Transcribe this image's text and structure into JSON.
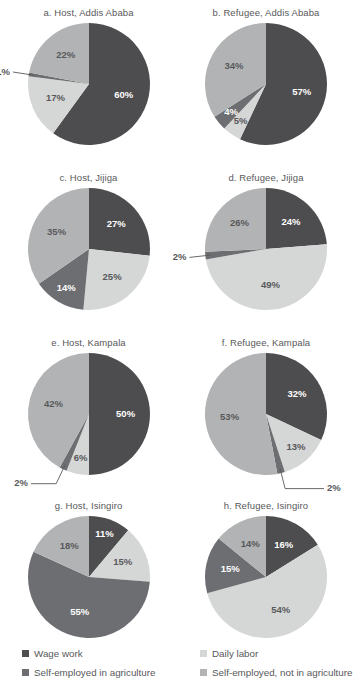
{
  "colors": {
    "wage_work": "#4d4d4f",
    "daily_labor": "#d5d6d6",
    "self_emp_ag": "#6d6e71",
    "self_emp_nonag": "#b1b3b4",
    "text": "#58595b",
    "background": "#ffffff"
  },
  "legend": {
    "items": [
      {
        "label": "Wage work",
        "color_key": "wage_work"
      },
      {
        "label": "Daily labor",
        "color_key": "daily_labor"
      },
      {
        "label": "Self-employed in agriculture",
        "color_key": "self_emp_ag"
      },
      {
        "label": "Self-employed, not in agriculture",
        "color_key": "self_emp_nonag"
      }
    ]
  },
  "chart_data": {
    "type": "pie",
    "title": "",
    "categories": [
      "Wage work",
      "Daily labor",
      "Self-employed in agriculture",
      "Self-employed, not in agriculture"
    ],
    "legend_position": "bottom",
    "units": "percent",
    "panels": [
      {
        "id": "a",
        "title": "a. Host, Addis Ababa",
        "values": [
          60,
          17,
          1,
          22
        ],
        "labels": [
          "60%",
          "17%",
          "1%",
          "22%"
        ],
        "callouts": [
          "1%"
        ]
      },
      {
        "id": "b",
        "title": "b. Refugee, Addis Ababa",
        "values": [
          57,
          5,
          4,
          34
        ],
        "labels": [
          "57%",
          "5%",
          "4%",
          "34%"
        ],
        "callouts": []
      },
      {
        "id": "c",
        "title": "c. Host, Jijiga",
        "values": [
          27,
          25,
          14,
          35
        ],
        "labels": [
          "27%",
          "25%",
          "14%",
          "35%"
        ],
        "callouts": []
      },
      {
        "id": "d",
        "title": "d. Refugee, Jijiga",
        "values": [
          24,
          49,
          2,
          26
        ],
        "labels": [
          "24%",
          "49%",
          "2%",
          "26%"
        ],
        "callouts": [
          "2%"
        ]
      },
      {
        "id": "e",
        "title": "e. Host, Kampala",
        "values": [
          50,
          6,
          2,
          42
        ],
        "labels": [
          "50%",
          "6%",
          "2%",
          "42%"
        ],
        "callouts": [
          "2%"
        ]
      },
      {
        "id": "f",
        "title": "f. Refugee, Kampala",
        "values": [
          32,
          13,
          2,
          53
        ],
        "labels": [
          "32%",
          "13%",
          "2%",
          "53%"
        ],
        "callouts": [
          "2%"
        ]
      },
      {
        "id": "g",
        "title": "g. Host, Isingiro",
        "values": [
          11,
          15,
          55,
          18
        ],
        "labels": [
          "11%",
          "15%",
          "55%",
          "18%"
        ],
        "callouts": []
      },
      {
        "id": "h",
        "title": "h. Refugee, Isingiro",
        "values": [
          16,
          54,
          15,
          14
        ],
        "labels": [
          "16%",
          "54%",
          "15%",
          "14%"
        ],
        "callouts": []
      }
    ]
  }
}
